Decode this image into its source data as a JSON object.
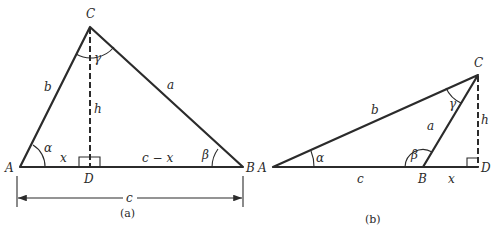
{
  "figure_a": {
    "caption": "(a)",
    "vertices": {
      "A": "A",
      "B": "B",
      "C": "C",
      "D": "D"
    },
    "sides": {
      "a": "a",
      "b": "b",
      "c": "c",
      "h": "h"
    },
    "segments": {
      "x": "x",
      "c_minus_x": "c − x"
    },
    "angles": {
      "alpha": "α",
      "beta": "β",
      "gamma": "γ"
    },
    "dimension_label": "c"
  },
  "figure_b": {
    "caption": "(b)",
    "vertices": {
      "A": "A",
      "B": "B",
      "C": "C",
      "D": "D"
    },
    "sides": {
      "a": "a",
      "b": "b",
      "c": "c",
      "h": "h"
    },
    "segments": {
      "x": "x"
    },
    "angles": {
      "alpha": "α",
      "beta": "β",
      "gamma": "γ"
    }
  }
}
